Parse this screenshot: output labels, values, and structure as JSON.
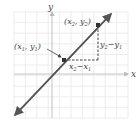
{
  "diagram": {
    "axis_x_label": "x",
    "axis_y_label": "y",
    "point1": {
      "label_open": "(",
      "x": "x",
      "xsub": "1",
      "comma": ", ",
      "y": "y",
      "ysub": "1",
      "label_close": ")"
    },
    "point2": {
      "label_open": "(",
      "x": "x",
      "xsub": "2",
      "comma": ", ",
      "y": "y",
      "ysub": "2",
      "label_close": ")"
    },
    "run": {
      "a": "x",
      "asub": "2",
      "minus": "−",
      "b": "x",
      "bsub": "1"
    },
    "rise": {
      "a": "y",
      "asub": "2",
      "minus": "−",
      "b": "y",
      "bsub": "1"
    },
    "colors": {
      "line": "#555555",
      "grid": "#e6e6e6",
      "axis": "#bdbdbd",
      "point": "#333333"
    }
  }
}
